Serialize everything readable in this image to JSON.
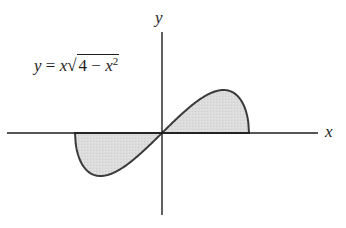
{
  "figure": {
    "equation": {
      "lhs": "y",
      "equals": "=",
      "factor": "x",
      "radical_sign": "√",
      "radicand_const": "4",
      "minus": "−",
      "radicand_var": "x",
      "exponent": "2",
      "full_text": "y = x√(4 − x²)"
    },
    "axes": {
      "x_label": "x",
      "y_label": "y"
    },
    "colors": {
      "stroke": "#3a3a3a",
      "fill": "#d9d9d9",
      "axis": "#1e1e1e"
    }
  },
  "chart_data": {
    "type": "area",
    "xlabel": "x",
    "ylabel": "y",
    "function": "x*sqrt(4 - x^2)",
    "domain": [
      -2,
      2
    ],
    "grid": false,
    "ticks": false,
    "shaded_regions": [
      {
        "name": "left-lobe",
        "x_range": [
          -2,
          0
        ],
        "sign": "negative"
      },
      {
        "name": "right-lobe",
        "x_range": [
          0,
          2
        ],
        "sign": "positive"
      }
    ],
    "x": [
      -2,
      -1.9,
      -1.75,
      -1.5,
      -1.414,
      -1.25,
      -1,
      -0.75,
      -0.5,
      -0.25,
      0,
      0.25,
      0.5,
      0.75,
      1,
      1.25,
      1.414,
      1.5,
      1.75,
      1.9,
      2
    ],
    "values": [
      0,
      -1.19,
      -1.69,
      -1.98,
      -2.0,
      -1.95,
      -1.73,
      -1.39,
      -0.97,
      -0.5,
      0,
      0.5,
      0.97,
      1.39,
      1.73,
      1.95,
      2.0,
      1.98,
      1.69,
      1.19,
      0
    ],
    "extrema": {
      "max": [
        1.414,
        2
      ],
      "min": [
        -1.414,
        -2
      ]
    }
  }
}
